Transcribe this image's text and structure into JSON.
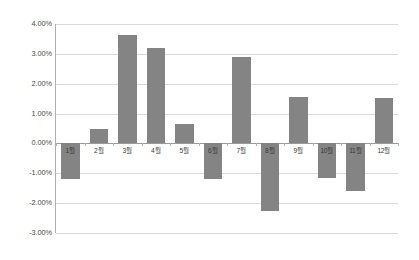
{
  "chart_data": {
    "type": "bar",
    "title": "",
    "subtitle": "",
    "xlabel": "",
    "ylabel": "",
    "categories": [
      "1월",
      "2월",
      "3월",
      "4월",
      "5월",
      "6월",
      "7월",
      "8월",
      "9월",
      "10월",
      "11월",
      "12월"
    ],
    "values": [
      -1.18,
      0.48,
      3.62,
      3.18,
      0.65,
      -1.18,
      2.88,
      -2.27,
      1.57,
      -1.15,
      -1.58,
      1.53
    ],
    "value_format": "percent",
    "ylim": [
      -3.0,
      4.0
    ],
    "ytick_step": 1.0,
    "ytick_labels": [
      "4.00%",
      "3.00%",
      "2.00%",
      "1.00%",
      "0.00%",
      "-1.00%",
      "-2.00%",
      "-3.00%"
    ],
    "ytick_values": [
      4.0,
      3.0,
      2.0,
      1.0,
      0.0,
      -1.0,
      -2.0,
      -3.0
    ],
    "grid": {
      "horizontal": true,
      "vertical": false,
      "color": "#d9d9d9"
    },
    "zero_line": {
      "value": 0.0,
      "color": "#9a9a9a"
    },
    "legend": {
      "visible": false,
      "position": "none",
      "entries": []
    },
    "series": [
      {
        "name": "",
        "color": "#848484",
        "values": [
          -1.18,
          0.48,
          3.62,
          3.18,
          0.65,
          -1.18,
          2.88,
          -2.27,
          1.57,
          -1.15,
          -1.58,
          1.53
        ]
      }
    ],
    "axis_label_position": "below-zero-line",
    "background_color": "#ffffff",
    "axis_line_color": "#b0b0b0"
  }
}
